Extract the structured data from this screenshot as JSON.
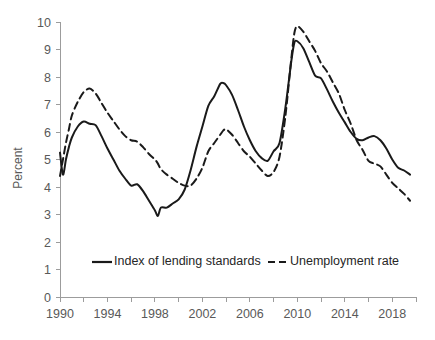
{
  "chart_data": {
    "type": "line",
    "title": "",
    "xlabel": "",
    "ylabel": "Percent",
    "ylim": [
      0,
      10
    ],
    "xlim": [
      1990,
      2020
    ],
    "grid": false,
    "legend_position": "inside-bottom-center",
    "y_ticks": [
      "0",
      "1",
      "2",
      "3",
      "4",
      "5",
      "6",
      "7",
      "8",
      "9",
      "10"
    ],
    "x_ticks": [
      "1990",
      "1992",
      "1994",
      "1996",
      "1998",
      "2000",
      "2002",
      "2004",
      "2006",
      "2008",
      "2010",
      "2012",
      "2014",
      "2016",
      "2018",
      "2020"
    ],
    "x_tick_labels": [
      "1990",
      "1994",
      "1998",
      "2002",
      "2006",
      "2010",
      "2014",
      "2018"
    ],
    "x": [
      1990.0,
      1990.25,
      1990.5,
      1990.75,
      1991.0,
      1991.5,
      1992.0,
      1992.5,
      1993.0,
      1993.5,
      1994.0,
      1994.5,
      1995.0,
      1995.5,
      1996.0,
      1996.5,
      1997.0,
      1997.5,
      1998.0,
      1998.25,
      1998.5,
      1999.0,
      1999.5,
      2000.0,
      2000.5,
      2001.0,
      2001.5,
      2002.0,
      2002.5,
      2003.0,
      2003.5,
      2003.75,
      2004.0,
      2004.5,
      2005.0,
      2005.5,
      2006.0,
      2006.5,
      2007.0,
      2007.5,
      2008.0,
      2008.5,
      2009.0,
      2009.5,
      2009.75,
      2010.0,
      2010.5,
      2011.0,
      2011.5,
      2012.0,
      2012.5,
      2013.0,
      2013.5,
      2014.0,
      2014.5,
      2015.0,
      2015.5,
      2016.0,
      2016.5,
      2017.0,
      2017.5,
      2018.0,
      2018.5,
      2019.0,
      2019.5
    ],
    "series": [
      {
        "name": "Index of lending standards",
        "style": "solid",
        "color": "#1a1a1a",
        "values": [
          5.25,
          4.45,
          5.0,
          5.45,
          5.8,
          6.2,
          6.38,
          6.3,
          6.25,
          5.85,
          5.4,
          5.0,
          4.6,
          4.3,
          4.05,
          4.1,
          3.85,
          3.5,
          3.15,
          2.95,
          3.25,
          3.25,
          3.4,
          3.55,
          3.9,
          4.6,
          5.45,
          6.2,
          6.95,
          7.3,
          7.75,
          7.78,
          7.7,
          7.35,
          6.8,
          6.2,
          5.7,
          5.3,
          5.05,
          4.95,
          5.3,
          5.6,
          6.9,
          8.6,
          9.25,
          9.3,
          9.05,
          8.55,
          8.05,
          7.95,
          7.55,
          7.1,
          6.7,
          6.35,
          6.0,
          5.75,
          5.7,
          5.8,
          5.85,
          5.7,
          5.4,
          5.0,
          4.7,
          4.6,
          4.45
        ]
      },
      {
        "name": "Unemployment rate",
        "style": "dashed",
        "color": "#1a1a1a",
        "values": [
          4.4,
          5.0,
          5.6,
          6.1,
          6.6,
          7.1,
          7.45,
          7.58,
          7.4,
          7.05,
          6.7,
          6.4,
          6.1,
          5.85,
          5.7,
          5.65,
          5.45,
          5.2,
          5.0,
          4.85,
          4.65,
          4.45,
          4.3,
          4.15,
          4.05,
          4.05,
          4.3,
          4.7,
          5.3,
          5.6,
          5.9,
          6.05,
          6.1,
          5.9,
          5.6,
          5.3,
          5.1,
          4.85,
          4.6,
          4.4,
          4.55,
          5.1,
          6.6,
          8.7,
          9.6,
          9.85,
          9.65,
          9.3,
          8.95,
          8.5,
          8.2,
          7.8,
          7.4,
          6.8,
          6.3,
          5.7,
          5.35,
          4.95,
          4.85,
          4.75,
          4.45,
          4.15,
          3.95,
          3.75,
          3.5
        ]
      }
    ],
    "legend": [
      {
        "label": "Index of lending standards",
        "style": "solid"
      },
      {
        "label": "Unemployment rate",
        "style": "dashed"
      }
    ]
  }
}
